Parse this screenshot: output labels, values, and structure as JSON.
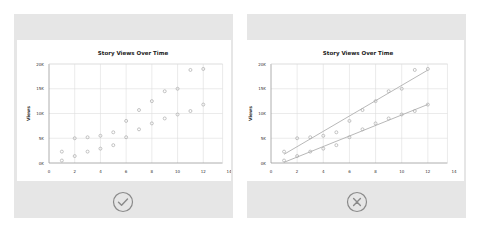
{
  "panels": [
    {
      "id": "good",
      "verdict": "correct",
      "verdict_icon": "check-circle-icon"
    },
    {
      "id": "bad",
      "verdict": "incorrect",
      "verdict_icon": "x-circle-icon"
    }
  ],
  "colors": {
    "panel_bg": "#e6e6e6",
    "grid": "#dddddd",
    "point": "#aaaaaa",
    "trend": "#b0b0b0",
    "icon": "#8a8a8a"
  },
  "chart_data": [
    {
      "type": "scatter",
      "title": "Story Views Over Time",
      "xlabel": "",
      "ylabel": "Views",
      "xlim": [
        0,
        14
      ],
      "ylim": [
        0,
        20000
      ],
      "x_ticks": [
        "0",
        "2",
        "4",
        "6",
        "8",
        "10",
        "12",
        "14"
      ],
      "y_ticks": [
        "0K",
        "5K",
        "10K",
        "15K",
        "20K"
      ],
      "grid": true,
      "trendlines": false,
      "series": [
        {
          "name": "upper",
          "x": [
            1,
            2,
            3,
            4,
            5,
            6,
            7,
            8,
            9,
            10,
            11,
            12
          ],
          "y": [
            2300,
            5000,
            5200,
            5500,
            6200,
            8500,
            10700,
            12500,
            14500,
            15000,
            18800,
            19000
          ]
        },
        {
          "name": "lower",
          "x": [
            1,
            2,
            3,
            4,
            5,
            6,
            7,
            8,
            9,
            10,
            11,
            12
          ],
          "y": [
            500,
            1400,
            2300,
            2900,
            3600,
            5200,
            6800,
            8000,
            9000,
            9800,
            10500,
            11800
          ]
        }
      ]
    },
    {
      "type": "scatter",
      "title": "Story Views Over Time",
      "xlabel": "",
      "ylabel": "Views",
      "xlim": [
        0,
        14
      ],
      "ylim": [
        0,
        20000
      ],
      "x_ticks": [
        "0",
        "2",
        "4",
        "6",
        "8",
        "10",
        "12",
        "14"
      ],
      "y_ticks": [
        "0K",
        "5K",
        "10K",
        "15K",
        "20K"
      ],
      "grid": true,
      "trendlines": true,
      "series": [
        {
          "name": "upper",
          "x": [
            1,
            2,
            3,
            4,
            5,
            6,
            7,
            8,
            9,
            10,
            11,
            12
          ],
          "y": [
            2300,
            5000,
            5200,
            5500,
            6200,
            8500,
            10700,
            12500,
            14500,
            15000,
            18800,
            19000
          ]
        },
        {
          "name": "lower",
          "x": [
            1,
            2,
            3,
            4,
            5,
            6,
            7,
            8,
            9,
            10,
            11,
            12
          ],
          "y": [
            500,
            1400,
            2300,
            2900,
            3600,
            5200,
            6800,
            8000,
            9000,
            9800,
            10500,
            11800
          ]
        }
      ]
    }
  ]
}
